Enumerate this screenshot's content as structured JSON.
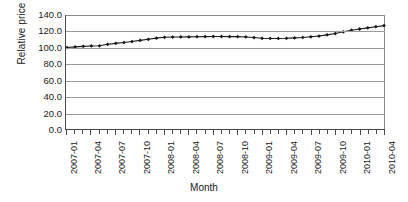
{
  "chart_data": {
    "type": "line",
    "title": "",
    "xlabel": "Month",
    "ylabel": "Relative price",
    "ylim": [
      0.0,
      140.0
    ],
    "ytick_labels": [
      "0.0",
      "20.0",
      "40.0",
      "60.0",
      "80.0",
      "100.0",
      "120.0",
      "140.0"
    ],
    "ytick_values": [
      0,
      20,
      40,
      60,
      80,
      100,
      120,
      140
    ],
    "grid": "horizontal",
    "legend": "none",
    "marker": "filled-diamond",
    "line_color": "#1a1a1a",
    "marker_color": "#1a1a1a",
    "x": [
      "2007-01",
      "2007-02",
      "2007-03",
      "2007-04",
      "2007-05",
      "2007-06",
      "2007-07",
      "2007-08",
      "2007-09",
      "2007-10",
      "2007-11",
      "2007-12",
      "2008-01",
      "2008-02",
      "2008-03",
      "2008-04",
      "2008-05",
      "2008-06",
      "2008-07",
      "2008-08",
      "2008-09",
      "2008-10",
      "2008-11",
      "2008-12",
      "2009-01",
      "2009-02",
      "2009-03",
      "2009-04",
      "2009-05",
      "2009-06",
      "2009-07",
      "2009-08",
      "2009-09",
      "2009-10",
      "2009-11",
      "2009-12",
      "2010-01",
      "2010-02",
      "2010-03",
      "2010-04"
    ],
    "values": [
      100.0,
      100.8,
      101.5,
      102.0,
      102.2,
      104.0,
      105.2,
      106.2,
      107.4,
      108.8,
      110.2,
      111.6,
      112.6,
      112.9,
      113.0,
      113.1,
      113.3,
      113.5,
      113.6,
      113.6,
      113.5,
      113.4,
      113.0,
      112.3,
      111.4,
      111.2,
      111.2,
      111.4,
      111.9,
      112.4,
      113.2,
      114.2,
      115.6,
      117.2,
      119.4,
      121.3,
      122.8,
      124.2,
      125.6,
      127.0
    ],
    "xtick_labels_shown": [
      "2007-01",
      "2007-04",
      "2007-07",
      "2007-10",
      "2008-01",
      "2008-04",
      "2008-07",
      "2008-10",
      "2009-01",
      "2009-04",
      "2009-07",
      "2009-10",
      "2010-01",
      "2010-04"
    ],
    "xtick_label_indices": [
      0,
      3,
      6,
      9,
      12,
      15,
      18,
      21,
      24,
      27,
      30,
      33,
      36,
      39
    ]
  }
}
